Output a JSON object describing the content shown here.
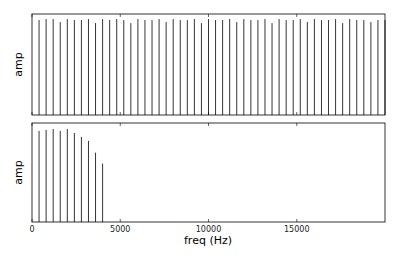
{
  "chart_data": [
    {
      "type": "bar",
      "subtype": "stem",
      "title": "",
      "xlabel": "",
      "ylabel": "amp",
      "xlim": [
        0,
        20000
      ],
      "ylim": [
        0,
        1.0
      ],
      "xticks": [
        0,
        5000,
        10000,
        15000
      ],
      "xtick_labels_visible": false,
      "grid": false,
      "series": [
        {
          "name": "spectrum (unfiltered)",
          "x": [
            400,
            800,
            1200,
            1600,
            2000,
            2400,
            2800,
            3200,
            3600,
            4000,
            4400,
            4800,
            5200,
            5600,
            6000,
            6400,
            6800,
            7200,
            7600,
            8000,
            8400,
            8800,
            9200,
            9600,
            10000,
            10400,
            10800,
            11200,
            11600,
            12000,
            12400,
            12800,
            13200,
            13600,
            14000,
            14400,
            14800,
            15200,
            15600,
            16000,
            16400,
            16800,
            17200,
            17600,
            18000,
            18400,
            18800,
            19200,
            19600,
            20000
          ],
          "values": [
            0.94,
            0.95,
            0.95,
            0.92,
            0.95,
            0.94,
            0.94,
            0.95,
            0.91,
            0.95,
            0.94,
            0.95,
            0.94,
            0.91,
            0.95,
            0.94,
            0.94,
            0.95,
            0.92,
            0.95,
            0.94,
            0.94,
            0.95,
            0.91,
            0.95,
            0.94,
            0.94,
            0.95,
            0.92,
            0.95,
            0.94,
            0.94,
            0.95,
            0.91,
            0.95,
            0.94,
            0.94,
            0.95,
            0.92,
            0.95,
            0.94,
            0.94,
            0.95,
            0.91,
            0.95,
            0.94,
            0.94,
            0.92,
            0.94,
            0.94
          ],
          "color": "#000000"
        }
      ]
    },
    {
      "type": "bar",
      "subtype": "stem",
      "title": "",
      "xlabel": "freq (Hz)",
      "ylabel": "amp",
      "xlim": [
        0,
        20000
      ],
      "ylim": [
        0,
        1.0
      ],
      "xticks": [
        0,
        5000,
        10000,
        15000
      ],
      "xtick_labels": [
        "0",
        "5000",
        "10000",
        "15000"
      ],
      "grid": false,
      "series": [
        {
          "name": "spectrum (low-pass filtered)",
          "x": [
            400,
            800,
            1200,
            1600,
            2000,
            2400,
            2800,
            3200,
            3600,
            4000
          ],
          "values": [
            0.92,
            0.93,
            0.94,
            0.92,
            0.94,
            0.9,
            0.86,
            0.82,
            0.7,
            0.59
          ],
          "color": "#000000"
        }
      ]
    }
  ],
  "labels": {
    "top_ylabel": "amp",
    "bottom_ylabel": "amp",
    "xlabel": "freq (Hz)",
    "tick_0": "0",
    "tick_5000": "5000",
    "tick_10000": "10000",
    "tick_15000": "15000"
  },
  "colors": {
    "stem": "#000000",
    "axes": "#000000",
    "background": "#ffffff"
  }
}
